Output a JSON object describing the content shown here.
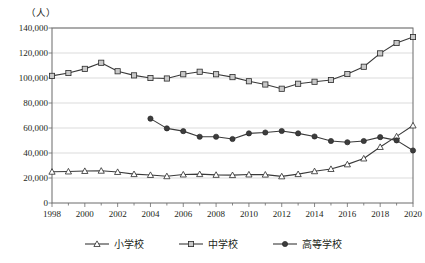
{
  "chart_data": {
    "type": "line",
    "title": "",
    "subtitle": "",
    "unit_label": "（人）",
    "xlabel": "",
    "ylabel": "",
    "x": [
      1998,
      1999,
      2000,
      2001,
      2002,
      2003,
      2004,
      2005,
      2006,
      2007,
      2008,
      2009,
      2010,
      2011,
      2012,
      2013,
      2014,
      2015,
      2016,
      2017,
      2018,
      2019,
      2020
    ],
    "xtick_labels": [
      "1998",
      "2000",
      "2002",
      "2004",
      "2006",
      "2008",
      "2010",
      "2012",
      "2014",
      "2016",
      "2018",
      "2020"
    ],
    "xtick_values": [
      1998,
      2000,
      2002,
      2004,
      2006,
      2008,
      2010,
      2012,
      2014,
      2016,
      2018,
      2020
    ],
    "xlim": [
      1998,
      2020
    ],
    "ylim": [
      0,
      140000
    ],
    "ytick_labels": [
      "0",
      "20,000",
      "40,000",
      "60,000",
      "80,000",
      "100,000",
      "120,000",
      "140,000"
    ],
    "ytick_values": [
      0,
      20000,
      40000,
      60000,
      80000,
      100000,
      120000,
      140000
    ],
    "grid": true,
    "legend_position": "bottom",
    "series": [
      {
        "name": "小学校",
        "marker": "triangle-open",
        "color": "#3a3a3a",
        "x": [
          1998,
          1999,
          2000,
          2001,
          2002,
          2003,
          2004,
          2005,
          2006,
          2007,
          2008,
          2009,
          2010,
          2011,
          2012,
          2013,
          2014,
          2015,
          2016,
          2017,
          2018,
          2019,
          2020
        ],
        "values": [
          25000,
          25200,
          25600,
          25800,
          24800,
          23100,
          22400,
          21400,
          22800,
          23100,
          22500,
          22300,
          22800,
          22700,
          21300,
          23100,
          25400,
          27200,
          30900,
          35600,
          44800,
          53300,
          62000
        ]
      },
      {
        "name": "中学校",
        "marker": "square-open",
        "color": "#3a3a3a",
        "x": [
          1998,
          1999,
          2000,
          2001,
          2002,
          2003,
          2004,
          2005,
          2006,
          2007,
          2008,
          2009,
          2010,
          2011,
          2012,
          2013,
          2014,
          2015,
          2016,
          2017,
          2018,
          2019,
          2020
        ],
        "values": [
          101700,
          104000,
          107300,
          112200,
          105400,
          102100,
          100000,
          99600,
          103000,
          105000,
          103000,
          100700,
          97400,
          94800,
          91400,
          95400,
          97000,
          98400,
          103200,
          109000,
          119700,
          128000,
          132800
        ]
      },
      {
        "name": "高等学校",
        "marker": "circle-filled",
        "color": "#3a3a3a",
        "x": [
          2004,
          2005,
          2006,
          2007,
          2008,
          2009,
          2010,
          2011,
          2012,
          2013,
          2014,
          2015,
          2016,
          2017,
          2018,
          2019,
          2020
        ],
        "values": [
          67500,
          59700,
          57500,
          53000,
          53000,
          51200,
          55700,
          56400,
          57600,
          55700,
          53200,
          49600,
          48600,
          49600,
          52700,
          50100,
          42000
        ]
      }
    ]
  }
}
